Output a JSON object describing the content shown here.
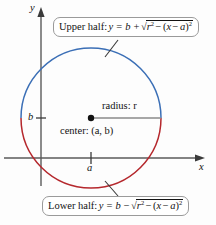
{
  "figure": {
    "background_color": "#fdfdfd",
    "axes": {
      "x_label": "x",
      "y_label": "y",
      "axis_color": "#5a5a5a",
      "x_tick_label": "a",
      "y_tick_label": "b"
    },
    "circle": {
      "center_x_px": 91,
      "center_y_px": 118,
      "radius_px": 70,
      "upper_color": "#3b6fb6",
      "lower_color": "#b5282d"
    },
    "annotations": {
      "radius_label": "radius: r",
      "center_label": "center: (a, b)",
      "center_dot_color": "#111111",
      "radius_line_color": "#8a8a8a"
    },
    "callouts": {
      "upper": {
        "prefix": "Upper half:",
        "lhs": "y",
        "equals": "=",
        "base": "b",
        "sign": "+",
        "radicand_first": "r",
        "radicand_first_sup": "2",
        "radicand_op": "−",
        "radicand_inner_open": "(",
        "radicand_inner_x": "x",
        "radicand_inner_minus": "−",
        "radicand_inner_a": "a",
        "radicand_inner_close": ")",
        "radicand_sup": "2",
        "radical_symbol": "√"
      },
      "lower": {
        "prefix": "Lower half:",
        "lhs": "y",
        "equals": "=",
        "base": "b",
        "sign": "−",
        "radicand_first": "r",
        "radicand_first_sup": "2",
        "radicand_op": "−",
        "radicand_inner_open": "(",
        "radicand_inner_x": "x",
        "radicand_inner_minus": "−",
        "radicand_inner_a": "a",
        "radicand_inner_close": ")",
        "radicand_sup": "2",
        "radical_symbol": "√"
      }
    }
  }
}
